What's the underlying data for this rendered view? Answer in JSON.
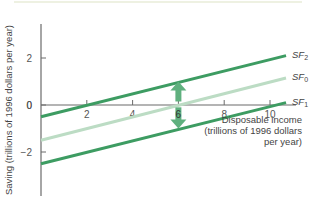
{
  "chart_data": {
    "type": "line",
    "title": "",
    "xlabel": "Disposable income (trillions of 1996 dollars per year)",
    "xlabel_lines": [
      "Disposable income",
      "(trillions of 1996 dollars",
      "per year)"
    ],
    "ylabel": "Saving (trillions of 1996 dollars per year)",
    "xlim": [
      0,
      10.7
    ],
    "ylim": [
      -3.8,
      3.3
    ],
    "x_ticks": [
      2,
      4,
      6,
      8,
      10
    ],
    "y_ticks": [
      -2,
      0,
      2
    ],
    "grid": false,
    "series": [
      {
        "name": "SF2",
        "label_main": "SF",
        "label_sub": "2",
        "x": [
          0,
          10.7
        ],
        "values": [
          -0.5,
          2.1
        ],
        "color": "#3d9c62",
        "width": 3
      },
      {
        "name": "SF0",
        "label_main": "SF",
        "label_sub": "0",
        "x": [
          0,
          10.7
        ],
        "values": [
          -1.5,
          1.15
        ],
        "color": "#bcdcc4",
        "width": 3
      },
      {
        "name": "SF1",
        "label_main": "SF",
        "label_sub": "1",
        "x": [
          0,
          10.7
        ],
        "values": [
          -2.5,
          0.1
        ],
        "color": "#3d9c62",
        "width": 3
      }
    ],
    "annotations": [
      {
        "type": "arrow-up",
        "x": 6,
        "from_y": 0.15,
        "to_y": 1.0,
        "meaning": "shift from SF0 to SF2"
      },
      {
        "type": "arrow-down",
        "x": 6,
        "from_y": -0.1,
        "to_y": -1.0,
        "meaning": "shift from SF0 to SF1"
      }
    ]
  },
  "colors": {
    "axis": "#6b6b6b",
    "dark_green": "#3d9c62",
    "light_green": "#bcdcc4",
    "arrow": "#5fb07e",
    "top_rule": "#e9ecd8"
  }
}
